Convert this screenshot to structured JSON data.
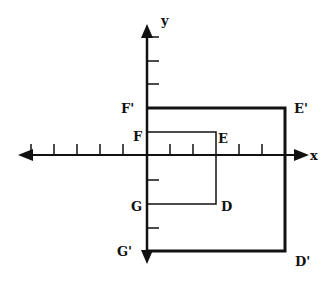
{
  "diagram": {
    "type": "coordinate-plane-dilation",
    "axes": {
      "x_label": "x",
      "y_label": "y",
      "origin_px": [
        147,
        155
      ],
      "unit_px": 23.3,
      "x_ticks": [
        -5,
        -4,
        -3,
        -2,
        -1,
        1,
        2,
        3,
        4,
        5,
        6
      ],
      "y_ticks": [
        3,
        2,
        1,
        -1,
        -2,
        -3,
        -4
      ]
    },
    "original_figure": {
      "name": "DEFG",
      "vertices": [
        {
          "label": "F",
          "x": 0,
          "y": 1
        },
        {
          "label": "E",
          "x": 3,
          "y": 1
        },
        {
          "label": "D",
          "x": 3,
          "y": -2
        },
        {
          "label": "G",
          "x": 0,
          "y": -2
        }
      ]
    },
    "image_figure": {
      "name": "D'E'F'G'",
      "vertices": [
        {
          "label": "F'",
          "x": 0,
          "y": 2
        },
        {
          "label": "E'",
          "x": 6,
          "y": 2
        },
        {
          "label": "D'",
          "x": 6,
          "y": -4
        },
        {
          "label": "G'",
          "x": 0,
          "y": -4
        }
      ]
    },
    "labels": {
      "F": "F",
      "E": "E",
      "D": "D",
      "G": "G",
      "F_prime": "F'",
      "E_prime": "E'",
      "D_prime": "D'",
      "G_prime": "G'",
      "x": "x",
      "y": "y"
    }
  }
}
